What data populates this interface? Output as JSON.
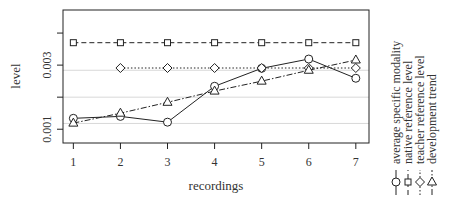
{
  "chart_data": {
    "type": "line",
    "title": "",
    "xlabel": "recordings",
    "ylabel": "level",
    "x": [
      1,
      2,
      3,
      4,
      5,
      6,
      7
    ],
    "xticks": [
      "1",
      "2",
      "3",
      "4",
      "5",
      "6",
      "7"
    ],
    "yticks": [
      {
        "value": 0.001,
        "label": "0.001"
      },
      {
        "value": 0.002,
        "label": ""
      },
      {
        "value": 0.003,
        "label": "0.003"
      },
      {
        "value": 0.004,
        "label": ""
      }
    ],
    "ylim": [
      0.00057,
      0.00472
    ],
    "xlim": [
      0.78,
      7.28
    ],
    "grid_y": [
      0.00118,
      0.002,
      0.00284
    ],
    "series": [
      {
        "name": "average specific modality",
        "marker": "circle",
        "line": "solid",
        "x": [
          1,
          2,
          3,
          4,
          5,
          6,
          7
        ],
        "values": [
          0.00134,
          0.0014,
          0.00122,
          0.00234,
          0.0029,
          0.00319,
          0.00259
        ]
      },
      {
        "name": "native reference level",
        "marker": "square",
        "line": "dashed",
        "x": [
          1,
          2,
          3,
          4,
          5,
          6,
          7
        ],
        "values": [
          0.0037,
          0.0037,
          0.0037,
          0.0037,
          0.0037,
          0.0037,
          0.0037
        ]
      },
      {
        "name": "teacher reference level",
        "marker": "diamond",
        "line": "dotted",
        "x": [
          2,
          3,
          4,
          5,
          6,
          7
        ],
        "values": [
          0.00291,
          0.00291,
          0.00291,
          0.00291,
          0.00291,
          0.00291
        ]
      },
      {
        "name": "development trend",
        "marker": "triangle",
        "line": "dashdot",
        "x": [
          1,
          2,
          3,
          4,
          5,
          6,
          7
        ],
        "values": [
          0.00119,
          0.0015,
          0.00184,
          0.00219,
          0.0025,
          0.00284,
          0.00316
        ]
      }
    ],
    "legend_position": "right (rotated vertical)"
  }
}
